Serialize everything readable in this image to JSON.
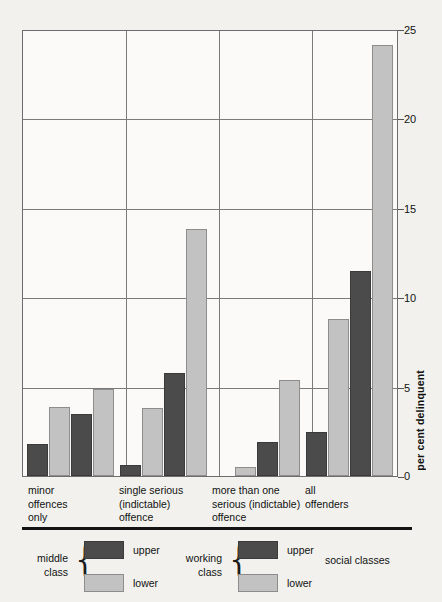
{
  "chart_data": {
    "type": "bar",
    "title": "",
    "xlabel": "",
    "ylabel": "per cent delinquent",
    "ylim": [
      0,
      25
    ],
    "yticks": [
      0,
      5,
      10,
      15,
      20,
      25
    ],
    "grid": true,
    "legend_position": "below-axes",
    "categories": [
      "minor\noffences\nonly",
      "single serious\n(indictable)\noffence",
      "more than one\nserious (indictable)\noffence",
      "all\noffenders"
    ],
    "series": [
      {
        "name": "middle class upper",
        "key": "upper",
        "values": [
          1.8,
          0.6,
          0.0,
          2.5
        ]
      },
      {
        "name": "middle class lower",
        "key": "lower",
        "values": [
          3.9,
          3.8,
          0.5,
          8.8
        ]
      },
      {
        "name": "working class upper",
        "key": "upper",
        "values": [
          3.5,
          5.8,
          1.9,
          11.5
        ]
      },
      {
        "name": "working class lower",
        "key": "lower",
        "values": [
          4.9,
          13.9,
          5.4,
          24.2
        ]
      }
    ],
    "colors": {
      "upper": "#4b4b4b",
      "lower": "#c2c2c2",
      "axis": "#6d6d6d",
      "grid": "#7a7a7a"
    }
  },
  "axis": {
    "y_label": "per cent delinquent",
    "ticks": [
      "0",
      "5",
      "10",
      "15",
      "20",
      "25"
    ]
  },
  "categories": [
    {
      "id": "minor-offences-only",
      "label": "minor\noffences\nonly"
    },
    {
      "id": "single-serious-indictable-offence",
      "label": "single serious\n(indictable)\noffence"
    },
    {
      "id": "more-than-one-serious-indictable-offence",
      "label": "more than one\nserious (indictable)\noffence"
    },
    {
      "id": "all-offenders",
      "label": "all\noffenders"
    }
  ],
  "legend": {
    "title": "social classes",
    "groups": [
      {
        "id": "middle-class",
        "name": "middle\nclass",
        "entries": [
          {
            "key": "upper",
            "label": "upper"
          },
          {
            "key": "lower",
            "label": "lower"
          }
        ]
      },
      {
        "id": "working-class",
        "name": "working\nclass",
        "entries": [
          {
            "key": "upper",
            "label": "upper"
          },
          {
            "key": "lower",
            "label": "lower"
          }
        ]
      }
    ]
  }
}
